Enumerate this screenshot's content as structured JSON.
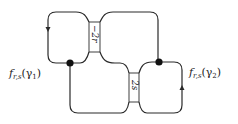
{
  "diagram": {
    "type": "knot-diagram",
    "labels": {
      "left": {
        "f": "f",
        "sub": "r,s",
        "arg": "(γ",
        "argsub": "1",
        "close": ")"
      },
      "right": {
        "f": "f",
        "sub": "r,s",
        "arg": "(γ",
        "argsub": "2",
        "close": ")"
      }
    },
    "boxes": [
      {
        "id": "box-top",
        "label": "−2r"
      },
      {
        "id": "box-bottom",
        "label": "2s"
      }
    ],
    "vertices": 2,
    "arrows": [
      "down-left",
      "up-right"
    ],
    "colors": {
      "stroke": "#2a2a2a",
      "box_fill": "#ffffff"
    }
  }
}
